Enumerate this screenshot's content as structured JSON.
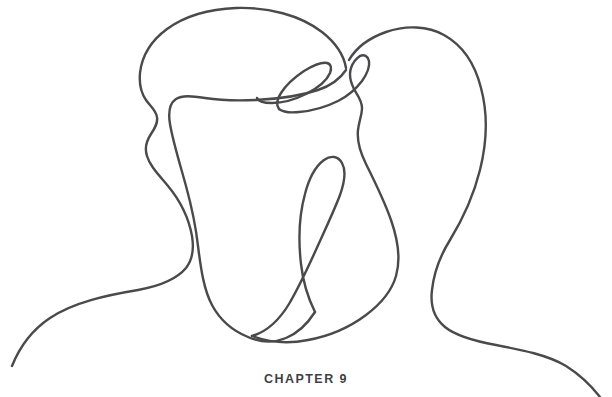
{
  "page": {
    "background_color": "#ffffff",
    "width": 612,
    "height": 397
  },
  "illustration": {
    "name": "two-faces-one-line-drawing",
    "description": "Single continuous line drawing of two profile heads facing each other",
    "stroke_color": "#4a4a4d",
    "stroke_width": 2.4,
    "fill": "none"
  },
  "caption": {
    "text": "CHAPTER 9",
    "color": "#3f3f44",
    "chapter_number": "9",
    "label": "CHAPTER"
  }
}
